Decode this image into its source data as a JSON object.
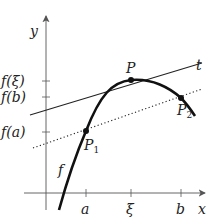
{
  "diagram": {
    "axes": {
      "x_label": "x",
      "y_label": "y"
    },
    "x_ticks": [
      "a",
      "ξ",
      "b"
    ],
    "y_ticks": [
      "f(ξ)",
      "f(b)",
      "f(a)"
    ],
    "curve_label": "f",
    "tangent_label": "t",
    "points": {
      "p": "P",
      "p1": "P",
      "p1_sub": "1",
      "p2": "P",
      "p2_sub": "2"
    },
    "colors": {
      "ink": "#222222",
      "axis": "#555555"
    }
  }
}
